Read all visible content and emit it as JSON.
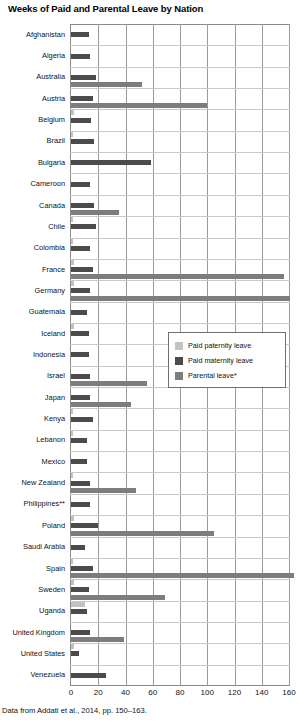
{
  "chart_data": {
    "type": "bar",
    "orientation": "horizontal",
    "title": "Weeks of Paid and Parental Leave by Nation",
    "xlabel": "",
    "ylabel": "",
    "xlim": [
      0,
      160
    ],
    "xticks": [
      0,
      20,
      40,
      60,
      80,
      100,
      120,
      140,
      160
    ],
    "grid": "vertical-major-and-horizontal-minor",
    "legend_position": "middle-right",
    "source_note": "Data from Addati et al., 2014, pp. 150–163.",
    "series": [
      {
        "name": "Paid paternity leave",
        "color": "#c2c2c2",
        "values": [
          0,
          0,
          0,
          0,
          2,
          0.8,
          0,
          0,
          0,
          1,
          1.1,
          2,
          1.9,
          0,
          2,
          0,
          0,
          0,
          0.3,
          1,
          0,
          0.6,
          0,
          2,
          0,
          0.4,
          2.1,
          10.3,
          0,
          2,
          0
        ]
      },
      {
        "name": "Paid maternity leave",
        "color": "#4b4b4b",
        "values": [
          13,
          14,
          18,
          16,
          15,
          17,
          58.6,
          14,
          17,
          18,
          14,
          16,
          14,
          12,
          13,
          13,
          14,
          14,
          16,
          12,
          12,
          14,
          14,
          20,
          10,
          16,
          12.9,
          12,
          14,
          6,
          26
        ]
      },
      {
        "name": "Parental leave*",
        "color": "#7d7d7d",
        "values": [
          0,
          0,
          52,
          100,
          0,
          0,
          0,
          0,
          35,
          0,
          0,
          156,
          161,
          0,
          0,
          0,
          56,
          44,
          0,
          0,
          0,
          48,
          0,
          105,
          0,
          164,
          69,
          0,
          39,
          0,
          0
        ]
      }
    ],
    "categories": [
      "Afghanistan",
      "Algeria",
      "Australia",
      "Austria",
      "Belgium",
      "Brazil",
      "Bulgaria",
      "Cameroon",
      "Canada",
      "Chile",
      "Colombia",
      "France",
      "Germany",
      "Guatemala",
      "Iceland",
      "Indonesia",
      "Israel",
      "Japan",
      "Kenya",
      "Lebanon",
      "Mexico",
      "New Zealand",
      "Philippines**",
      "Poland",
      "Saudi Arabia",
      "Spain",
      "Sweden",
      "Uganda",
      "United Kingdom",
      "United States",
      "Venezuela"
    ]
  },
  "legend": {
    "items": [
      {
        "label": "Paid paternity leave",
        "key": "paternity"
      },
      {
        "label": "Paid maternity leave",
        "key": "maternity"
      },
      {
        "label": "Parental leave*",
        "key": "parental"
      }
    ]
  }
}
